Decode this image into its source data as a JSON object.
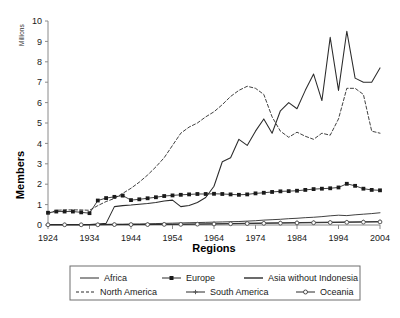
{
  "chart_data": {
    "type": "line",
    "title": "",
    "xlabel": "Regions",
    "ylabel": "Members",
    "yunit": "Millions",
    "xlim": [
      1924,
      2004
    ],
    "ylim": [
      0,
      10
    ],
    "ytick_labels": [
      "0",
      "1",
      "2",
      "3",
      "4",
      "5",
      "6",
      "7",
      "8",
      "9",
      "10"
    ],
    "yticks": [
      0,
      1,
      2,
      3,
      4,
      5,
      6,
      7,
      8,
      9,
      10
    ],
    "xtick_labels": [
      "1924",
      "1934",
      "1944",
      "1954",
      "1964",
      "1974",
      "1984",
      "1994",
      "2004"
    ],
    "xticks": [
      1924,
      1934,
      1944,
      1954,
      1964,
      1974,
      1984,
      1994,
      2004
    ],
    "grid": false,
    "legend_position": "bottom",
    "series": [
      {
        "name": "Africa",
        "style": "solid",
        "marker": "none",
        "color": "#2b2b2b",
        "x": [
          1924,
          1926,
          1928,
          1930,
          1932,
          1934,
          1936,
          1938,
          1940,
          1942,
          1944,
          1946,
          1948,
          1950,
          1952,
          1954,
          1956,
          1958,
          1960,
          1962,
          1964,
          1966,
          1968,
          1970,
          1972,
          1974,
          1976,
          1978,
          1980,
          1982,
          1984,
          1986,
          1988,
          1990,
          1992,
          1994,
          1996,
          1998,
          2000,
          2002,
          2004
        ],
        "y": [
          0.02,
          0.02,
          0.02,
          0.02,
          0.02,
          0.02,
          0.03,
          0.03,
          0.04,
          0.04,
          0.05,
          0.05,
          0.06,
          0.07,
          0.08,
          0.09,
          0.1,
          0.11,
          0.12,
          0.13,
          0.14,
          0.15,
          0.16,
          0.17,
          0.19,
          0.21,
          0.24,
          0.26,
          0.28,
          0.31,
          0.33,
          0.36,
          0.38,
          0.41,
          0.45,
          0.48,
          0.46,
          0.5,
          0.53,
          0.56,
          0.6
        ]
      },
      {
        "name": "Europe",
        "style": "solid",
        "marker": "square",
        "color": "#1a1a1a",
        "x": [
          1924,
          1926,
          1928,
          1930,
          1932,
          1934,
          1936,
          1938,
          1940,
          1942,
          1944,
          1946,
          1948,
          1950,
          1952,
          1954,
          1956,
          1958,
          1960,
          1962,
          1964,
          1966,
          1968,
          1970,
          1972,
          1974,
          1976,
          1978,
          1980,
          1982,
          1984,
          1986,
          1988,
          1990,
          1992,
          1994,
          1996,
          1998,
          2000,
          2002,
          2004
        ],
        "y": [
          0.6,
          0.66,
          0.66,
          0.66,
          0.62,
          0.58,
          1.2,
          1.32,
          1.38,
          1.44,
          1.22,
          1.26,
          1.31,
          1.36,
          1.42,
          1.45,
          1.48,
          1.5,
          1.52,
          1.52,
          1.53,
          1.52,
          1.5,
          1.48,
          1.5,
          1.55,
          1.58,
          1.62,
          1.65,
          1.66,
          1.68,
          1.72,
          1.76,
          1.78,
          1.8,
          1.84,
          2.02,
          1.92,
          1.78,
          1.72,
          1.7
        ]
      },
      {
        "name": "Asia without Indonesia",
        "style": "solid",
        "marker": "none",
        "color": "#2b2b2b",
        "x": [
          1924,
          1928,
          1932,
          1934,
          1936,
          1938,
          1940,
          1942,
          1944,
          1946,
          1948,
          1950,
          1952,
          1954,
          1956,
          1958,
          1960,
          1962,
          1964,
          1966,
          1968,
          1970,
          1972,
          1974,
          1976,
          1978,
          1980,
          1982,
          1984,
          1986,
          1988,
          1990,
          1992,
          1994,
          1996,
          1998,
          2000,
          2002,
          2004
        ],
        "y": [
          0.02,
          0.02,
          0.02,
          0.02,
          0.05,
          0.08,
          0.9,
          0.95,
          0.98,
          1.02,
          1.05,
          1.1,
          1.18,
          1.22,
          0.9,
          0.96,
          1.1,
          1.35,
          1.9,
          3.1,
          3.3,
          4.2,
          3.9,
          4.6,
          5.2,
          4.5,
          5.6,
          6.0,
          5.7,
          6.6,
          7.4,
          6.1,
          9.2,
          6.6,
          9.5,
          7.2,
          7.0,
          7.0,
          7.7
        ]
      },
      {
        "name": "North America",
        "style": "dashed",
        "marker": "none",
        "color": "#2b2b2b",
        "x": [
          1924,
          1926,
          1928,
          1930,
          1932,
          1934,
          1936,
          1938,
          1940,
          1942,
          1944,
          1946,
          1948,
          1950,
          1952,
          1954,
          1956,
          1958,
          1960,
          1962,
          1964,
          1966,
          1968,
          1970,
          1972,
          1974,
          1976,
          1978,
          1980,
          1982,
          1984,
          1986,
          1988,
          1990,
          1992,
          1994,
          1996,
          1998,
          2000,
          2002,
          2004
        ],
        "y": [
          0.55,
          0.72,
          0.74,
          0.74,
          0.74,
          0.72,
          0.95,
          1.15,
          1.3,
          1.55,
          1.8,
          2.1,
          2.45,
          2.85,
          3.3,
          3.9,
          4.5,
          4.8,
          5.0,
          5.3,
          5.55,
          5.9,
          6.3,
          6.6,
          6.8,
          6.7,
          6.4,
          5.3,
          4.6,
          4.3,
          4.55,
          4.35,
          4.2,
          4.5,
          4.4,
          5.2,
          6.7,
          6.7,
          6.4,
          4.6,
          4.5
        ]
      },
      {
        "name": "South America",
        "style": "solid",
        "marker": "plus",
        "color": "#555555",
        "x": [
          1924,
          1928,
          1932,
          1936,
          1940,
          1944,
          1948,
          1952,
          1956,
          1960,
          1964,
          1968,
          1972,
          1976,
          1980,
          1984,
          1988,
          1992,
          1996,
          2000,
          2004
        ],
        "y": [
          0.01,
          0.01,
          0.01,
          0.02,
          0.02,
          0.02,
          0.03,
          0.03,
          0.04,
          0.05,
          0.06,
          0.07,
          0.09,
          0.1,
          0.11,
          0.12,
          0.13,
          0.14,
          0.15,
          0.16,
          0.17
        ]
      },
      {
        "name": "Oceania",
        "style": "solid",
        "marker": "circle",
        "color": "#4a4a4a",
        "x": [
          1924,
          1928,
          1932,
          1936,
          1940,
          1944,
          1948,
          1952,
          1956,
          1960,
          1964,
          1968,
          1972,
          1976,
          1980,
          1984,
          1988,
          1992,
          1996,
          2000,
          2004
        ],
        "y": [
          0.01,
          0.01,
          0.01,
          0.01,
          0.02,
          0.02,
          0.02,
          0.03,
          0.03,
          0.04,
          0.05,
          0.06,
          0.07,
          0.08,
          0.09,
          0.1,
          0.11,
          0.12,
          0.13,
          0.14,
          0.15
        ]
      }
    ]
  },
  "legend": {
    "items": [
      {
        "label": "Africa",
        "style": "solid",
        "marker": "none"
      },
      {
        "label": "Europe",
        "style": "solid",
        "marker": "square"
      },
      {
        "label": "Asia without Indonesia",
        "style": "solid",
        "marker": "none"
      },
      {
        "label": "North America",
        "style": "dashed",
        "marker": "none"
      },
      {
        "label": "South America",
        "style": "solid",
        "marker": "plus"
      },
      {
        "label": "Oceania",
        "style": "solid",
        "marker": "circle"
      }
    ]
  }
}
